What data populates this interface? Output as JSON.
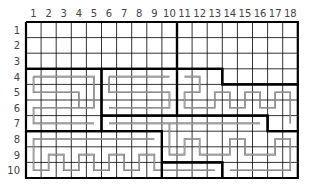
{
  "grid": {
    "cols": 18,
    "rows": 10,
    "origin_x": 26,
    "origin_y": 22,
    "cell_w": 15.1,
    "cell_h": 15.6,
    "col_labels": [
      "1",
      "2",
      "3",
      "4",
      "5",
      "6",
      "7",
      "8",
      "9",
      "10",
      "11",
      "12",
      "13",
      "14",
      "15",
      "16",
      "17",
      "18"
    ],
    "row_labels": [
      "1",
      "2",
      "3",
      "4",
      "5",
      "6",
      "7",
      "8",
      "9",
      "10"
    ],
    "colors": {
      "grid": "#000000",
      "border": "#000000",
      "path": "#555555",
      "label": "#444444"
    }
  },
  "regions": [
    {
      "name": "top-left",
      "outline": [
        [
          0,
          0
        ],
        [
          10,
          0
        ],
        [
          10,
          3
        ],
        [
          0,
          3
        ],
        [
          0,
          0
        ]
      ]
    },
    {
      "name": "top-right",
      "outline": [
        [
          10,
          0
        ],
        [
          18,
          0
        ],
        [
          18,
          4
        ],
        [
          13,
          4
        ],
        [
          13,
          3
        ],
        [
          10,
          3
        ],
        [
          10,
          0
        ]
      ]
    },
    {
      "name": "mid-left",
      "outline": [
        [
          0,
          3
        ],
        [
          5,
          3
        ],
        [
          5,
          7
        ],
        [
          0,
          7
        ],
        [
          0,
          3
        ]
      ]
    },
    {
      "name": "mid-center",
      "outline": [
        [
          5,
          3
        ],
        [
          10,
          3
        ],
        [
          10,
          6
        ],
        [
          5,
          6
        ],
        [
          5,
          3
        ]
      ]
    },
    {
      "name": "mid-right",
      "outline": [
        [
          10,
          3
        ],
        [
          13,
          3
        ],
        [
          13,
          4
        ],
        [
          18,
          4
        ],
        [
          18,
          7
        ],
        [
          16,
          7
        ],
        [
          16,
          6
        ],
        [
          10,
          6
        ],
        [
          10,
          3
        ]
      ]
    },
    {
      "name": "lower-center",
      "outline": [
        [
          5,
          6
        ],
        [
          16,
          6
        ],
        [
          16,
          7
        ],
        [
          18,
          7
        ],
        [
          18,
          10
        ],
        [
          13,
          10
        ],
        [
          13,
          9
        ],
        [
          9,
          9
        ],
        [
          9,
          7
        ],
        [
          5,
          7
        ],
        [
          5,
          6
        ]
      ]
    },
    {
      "name": "bottom-left",
      "outline": [
        [
          0,
          7
        ],
        [
          9,
          7
        ],
        [
          9,
          10
        ],
        [
          0,
          10
        ],
        [
          0,
          7
        ]
      ]
    },
    {
      "name": "bottom-center",
      "outline": [
        [
          9,
          9
        ],
        [
          13,
          9
        ],
        [
          13,
          10
        ],
        [
          9,
          10
        ],
        [
          9,
          9
        ]
      ]
    }
  ],
  "paths": [
    {
      "name": "snake-mid-left",
      "points": [
        [
          0.5,
          3.5
        ],
        [
          4.5,
          3.5
        ],
        [
          4.5,
          5.5
        ],
        [
          0.5,
          5.5
        ],
        [
          0.5,
          6.5
        ],
        [
          4.5,
          6.5
        ]
      ]
    },
    {
      "name": "snake-mid-left-inner",
      "points": [
        [
          0.5,
          3.5
        ],
        [
          0.5,
          4.5
        ],
        [
          3.5,
          4.5
        ],
        [
          3.5,
          5.5
        ]
      ]
    },
    {
      "name": "snake-mid-center",
      "points": [
        [
          5.5,
          3.5
        ],
        [
          9.5,
          3.5
        ]
      ]
    },
    {
      "name": "snake-mid-center-2",
      "points": [
        [
          5.5,
          3.5
        ],
        [
          5.5,
          4.5
        ],
        [
          9.5,
          4.5
        ],
        [
          9.5,
          5.5
        ],
        [
          5.5,
          5.5
        ]
      ]
    },
    {
      "name": "snake-mid-right",
      "points": [
        [
          10.5,
          3.5
        ],
        [
          11.5,
          3.5
        ],
        [
          11.5,
          4.5
        ],
        [
          10.5,
          4.5
        ],
        [
          10.5,
          5.5
        ],
        [
          12.5,
          5.5
        ],
        [
          12.5,
          4.5
        ],
        [
          13.5,
          4.5
        ],
        [
          13.5,
          5.5
        ],
        [
          14.5,
          5.5
        ],
        [
          14.5,
          4.5
        ],
        [
          15.5,
          4.5
        ],
        [
          15.5,
          5.5
        ],
        [
          16.5,
          5.5
        ],
        [
          16.5,
          4.5
        ],
        [
          17.5,
          4.5
        ],
        [
          17.5,
          6.5
        ]
      ]
    },
    {
      "name": "snake-lower-center",
      "points": [
        [
          5.5,
          6.5
        ],
        [
          15.5,
          6.5
        ],
        [
          15.5,
          6.5
        ]
      ]
    },
    {
      "name": "snake-lower-right",
      "points": [
        [
          9.5,
          6.5
        ],
        [
          9.5,
          8.5
        ],
        [
          10.5,
          8.5
        ],
        [
          10.5,
          7.5
        ],
        [
          11.5,
          7.5
        ],
        [
          11.5,
          8.5
        ],
        [
          13.5,
          8.5
        ],
        [
          13.5,
          7.5
        ],
        [
          14.5,
          7.5
        ],
        [
          14.5,
          8.5
        ],
        [
          16.5,
          8.5
        ],
        [
          16.5,
          7.5
        ],
        [
          17.5,
          7.5
        ],
        [
          17.5,
          9.5
        ],
        [
          13.5,
          9.5
        ]
      ]
    },
    {
      "name": "snake-bottom-left",
      "points": [
        [
          8.5,
          7.5
        ],
        [
          0.5,
          7.5
        ],
        [
          0.5,
          9.5
        ],
        [
          1.5,
          9.5
        ],
        [
          1.5,
          8.5
        ],
        [
          2.5,
          8.5
        ],
        [
          2.5,
          9.5
        ],
        [
          3.5,
          9.5
        ],
        [
          3.5,
          8.5
        ],
        [
          4.5,
          8.5
        ],
        [
          4.5,
          9.5
        ],
        [
          5.5,
          9.5
        ],
        [
          5.5,
          8.5
        ],
        [
          6.5,
          8.5
        ],
        [
          6.5,
          9.5
        ],
        [
          7.5,
          9.5
        ],
        [
          7.5,
          8.5
        ],
        [
          8.5,
          8.5
        ],
        [
          8.5,
          9.5
        ],
        [
          12.5,
          9.5
        ]
      ]
    }
  ]
}
